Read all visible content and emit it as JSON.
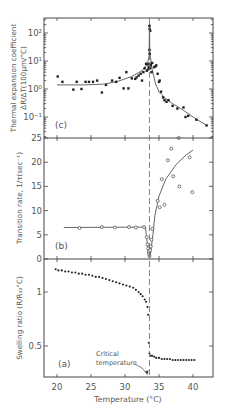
{
  "figure": {
    "xlabel": "Temperature (°C)",
    "critical_label_line1": "Critical",
    "critical_label_line2": "temperature",
    "critical_temperature": 33.6
  },
  "chart_data": [
    {
      "panel": "c",
      "type": "scatter",
      "title": "(c)",
      "xlabel": "Temperature (°C)",
      "ylabel": "Thermal expansion coefficient ΔR/ΔT(100μm/°C)",
      "yscale": "log",
      "xlim": [
        18,
        43
      ],
      "ylim": [
        0.018,
        300
      ],
      "yticks": [
        {
          "v": 100,
          "label": "10²"
        },
        {
          "v": 10,
          "label": "10¹"
        },
        {
          "v": 1,
          "label": "10⁰"
        },
        {
          "v": 0.1,
          "label": "10⁻¹"
        }
      ],
      "marker": "filled-square",
      "points": [
        [
          20.1,
          2.8
        ],
        [
          20.8,
          1.8
        ],
        [
          22.4,
          0.95
        ],
        [
          22.9,
          1.8
        ],
        [
          23.6,
          1.0
        ],
        [
          24.2,
          1.8
        ],
        [
          24.7,
          1.8
        ],
        [
          25.3,
          1.8
        ],
        [
          25.9,
          2.0
        ],
        [
          26.6,
          0.75
        ],
        [
          27.2,
          1.4
        ],
        [
          28.1,
          2.0
        ],
        [
          28.7,
          1.8
        ],
        [
          29.2,
          2.5
        ],
        [
          29.8,
          1.05
        ],
        [
          30.2,
          4.0
        ],
        [
          30.5,
          1.05
        ],
        [
          31.0,
          2.4
        ],
        [
          31.5,
          2.3
        ],
        [
          31.7,
          2.6
        ],
        [
          32.0,
          3.0
        ],
        [
          32.3,
          3.5
        ],
        [
          32.5,
          2.0
        ],
        [
          32.7,
          4.0
        ],
        [
          32.9,
          5.5
        ],
        [
          33.1,
          8.0
        ],
        [
          33.2,
          4.5
        ],
        [
          33.3,
          7.5
        ],
        [
          33.4,
          5.0
        ],
        [
          33.5,
          6.0
        ],
        [
          33.6,
          8.0
        ],
        [
          33.7,
          5.5
        ],
        [
          33.8,
          7.0
        ],
        [
          33.9,
          4.0
        ],
        [
          34.0,
          8.5
        ],
        [
          34.3,
          6.0
        ],
        [
          34.5,
          6.5
        ],
        [
          33.6,
          25
        ],
        [
          33.65,
          18
        ],
        [
          33.6,
          180
        ],
        [
          33.62,
          140
        ],
        [
          33.7,
          120
        ],
        [
          34.6,
          7.0
        ],
        [
          34.8,
          3.5
        ],
        [
          35.0,
          1.8
        ],
        [
          35.1,
          2.0
        ],
        [
          35.3,
          0.8
        ],
        [
          35.6,
          0.5
        ],
        [
          35.8,
          0.4
        ],
        [
          36.1,
          0.35
        ],
        [
          36.4,
          0.4
        ],
        [
          37.0,
          0.25
        ],
        [
          37.7,
          0.2
        ],
        [
          38.6,
          0.22
        ],
        [
          38.9,
          0.1
        ],
        [
          39.3,
          0.11
        ],
        [
          40.5,
          0.08
        ],
        [
          42.0,
          0.05
        ]
      ],
      "fit_curve": [
        [
          20,
          1.4
        ],
        [
          24,
          1.4
        ],
        [
          27,
          1.5
        ],
        [
          29,
          1.9
        ],
        [
          31,
          2.8
        ],
        [
          32.5,
          4.5
        ],
        [
          33.3,
          8
        ],
        [
          33.55,
          15
        ],
        [
          33.6,
          200
        ],
        [
          33.65,
          20
        ],
        [
          34.0,
          5
        ],
        [
          34.5,
          1.5
        ],
        [
          35.0,
          0.8
        ],
        [
          36.0,
          0.45
        ],
        [
          37.0,
          0.3
        ],
        [
          38.5,
          0.18
        ],
        [
          40.0,
          0.1
        ],
        [
          42.0,
          0.05
        ]
      ]
    },
    {
      "panel": "b",
      "type": "scatter",
      "title": "(b)",
      "xlabel": "Temperature (°C)",
      "ylabel": "Transition rate, 1/τ(sec⁻¹)",
      "xlim": [
        18,
        43
      ],
      "ylim": [
        0,
        25
      ],
      "yticks": [
        0,
        5,
        10,
        15,
        20,
        25
      ],
      "marker": "open-circle",
      "points": [
        [
          23.3,
          6.4
        ],
        [
          26.6,
          6.6
        ],
        [
          28.5,
          6.5
        ],
        [
          30.6,
          6.6
        ],
        [
          31.6,
          6.5
        ],
        [
          32.8,
          6.6
        ],
        [
          33.2,
          4.5
        ],
        [
          33.3,
          3.0
        ],
        [
          33.4,
          2.2
        ],
        [
          33.5,
          1.5
        ],
        [
          33.55,
          1.0
        ],
        [
          33.6,
          0.6
        ],
        [
          33.7,
          1.8
        ],
        [
          33.8,
          2.6
        ],
        [
          33.9,
          4.0
        ],
        [
          34.0,
          6.2
        ],
        [
          34.8,
          12.0
        ],
        [
          35.1,
          10.7
        ],
        [
          35.4,
          16.5
        ],
        [
          35.8,
          11.2
        ],
        [
          36.3,
          20.4
        ],
        [
          36.8,
          22.8
        ],
        [
          37.1,
          17.1
        ],
        [
          37.9,
          25.5
        ],
        [
          38.0,
          15.0
        ],
        [
          39.5,
          21.0
        ],
        [
          39.9,
          13.8
        ]
      ],
      "fit_curve": [
        [
          21.0,
          6.5
        ],
        [
          33.0,
          6.6
        ],
        [
          33.2,
          4.0
        ],
        [
          33.4,
          1.5
        ],
        [
          33.6,
          0.5
        ],
        [
          33.8,
          1.5
        ],
        [
          34.1,
          5.0
        ],
        [
          34.4,
          9.0
        ],
        [
          35.0,
          13.0
        ],
        [
          36.0,
          16.5
        ],
        [
          37.5,
          19.5
        ],
        [
          39.0,
          21.5
        ],
        [
          40.0,
          22.5
        ]
      ]
    },
    {
      "panel": "a",
      "type": "scatter",
      "title": "(a)",
      "xlabel": "Temperature (°C)",
      "ylabel": "Swelling ratio (R/R₃₂°C)",
      "xlim": [
        18,
        43
      ],
      "ylim": [
        0.21,
        1.31
      ],
      "yticks": [
        0.5,
        1.0
      ],
      "xticks": [
        20,
        25,
        30,
        35,
        40
      ],
      "marker": "filled-circle",
      "points": [
        [
          19.8,
          1.21
        ],
        [
          20.2,
          1.2
        ],
        [
          20.7,
          1.2
        ],
        [
          21.2,
          1.19
        ],
        [
          21.7,
          1.19
        ],
        [
          22.2,
          1.18
        ],
        [
          22.7,
          1.18
        ],
        [
          23.2,
          1.17
        ],
        [
          23.7,
          1.17
        ],
        [
          24.2,
          1.16
        ],
        [
          24.7,
          1.16
        ],
        [
          25.2,
          1.15
        ],
        [
          25.7,
          1.14
        ],
        [
          26.2,
          1.14
        ],
        [
          26.7,
          1.13
        ],
        [
          27.2,
          1.12
        ],
        [
          27.7,
          1.11
        ],
        [
          28.2,
          1.1
        ],
        [
          28.7,
          1.09
        ],
        [
          29.2,
          1.08
        ],
        [
          29.7,
          1.07
        ],
        [
          30.2,
          1.06
        ],
        [
          30.7,
          1.05
        ],
        [
          31.2,
          1.04
        ],
        [
          31.6,
          1.02
        ],
        [
          32.0,
          1.0
        ],
        [
          32.3,
          0.98
        ],
        [
          32.6,
          0.96
        ],
        [
          32.9,
          0.93
        ],
        [
          33.1,
          0.91
        ],
        [
          33.3,
          0.86
        ],
        [
          33.4,
          0.79
        ],
        [
          33.5,
          0.53
        ],
        [
          33.6,
          0.43
        ],
        [
          33.8,
          0.41
        ],
        [
          34.0,
          0.41
        ],
        [
          34.3,
          0.4
        ],
        [
          34.6,
          0.39
        ],
        [
          35.0,
          0.39
        ],
        [
          35.4,
          0.38
        ],
        [
          35.8,
          0.38
        ],
        [
          36.2,
          0.38
        ],
        [
          36.6,
          0.38
        ],
        [
          37.0,
          0.37
        ],
        [
          37.4,
          0.37
        ],
        [
          37.8,
          0.37
        ],
        [
          38.2,
          0.37
        ],
        [
          38.6,
          0.37
        ],
        [
          39.0,
          0.37
        ],
        [
          39.4,
          0.37
        ],
        [
          39.8,
          0.37
        ],
        [
          40.2,
          0.37
        ]
      ]
    }
  ]
}
